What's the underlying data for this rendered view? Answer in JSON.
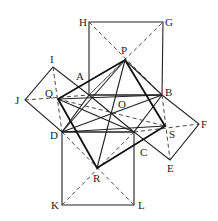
{
  "diagram": {
    "points": {
      "H": [
        89,
        22
      ],
      "G": [
        163,
        22
      ],
      "P": [
        125,
        60
      ],
      "I": [
        53,
        67
      ],
      "A": [
        89,
        95
      ],
      "B": [
        162,
        95
      ],
      "Q": [
        58,
        99
      ],
      "J": [
        25,
        100
      ],
      "O": [
        111,
        113
      ],
      "D": [
        62,
        132
      ],
      "C": [
        134,
        132
      ],
      "S": [
        165,
        126
      ],
      "F": [
        199,
        124
      ],
      "E": [
        170,
        160
      ],
      "R": [
        97,
        168
      ],
      "K": [
        62,
        205
      ],
      "L": [
        134,
        205
      ]
    },
    "labels": {
      "H": "H",
      "G": "G",
      "P": "P",
      "I": "I",
      "A": "A",
      "B": "B",
      "Q": "Q",
      "J": "J",
      "O": "O",
      "D": "D",
      "C": "C",
      "S": "S",
      "F": "F",
      "E": "E",
      "R": "R",
      "K": "K",
      "L": "L"
    }
  }
}
